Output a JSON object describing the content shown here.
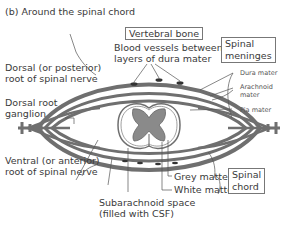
{
  "title": "(b)  Around the spinal chord",
  "labels": {
    "vertebral_bone": "Vertebral bone",
    "blood_vessels_1": "Blood vessels  between",
    "blood_vessels_2": "layers of dura mater",
    "spinal_meninges_1": "Spinal",
    "spinal_meninges_2": "meninges",
    "dura_mater": "Dura mater",
    "arachnoid_mater_1": "Arachnoid",
    "arachnoid_mater_2": "mater",
    "pia_mater": "Pia mater",
    "dorsal_root_1": "Dorsal (or posterior)",
    "dorsal_root_2": "root of spinal nerve",
    "dorsal_ganglion_1": "Dorsal root",
    "dorsal_ganglion_2": "ganglion",
    "ventral_root_1": "Ventral (or anterior)",
    "ventral_root_2": "root of spinal nerve",
    "grey_matter": "Grey matter",
    "white_matter": "White matter",
    "spinal_chord_1": "Spinal",
    "spinal_chord_2": "chord",
    "subarachnoid_1": "Subarachnoid space",
    "subarachnoid_2": "(filled with CSF)"
  },
  "colors": {
    "membrane": "#6f6f6f",
    "grey_matter": "#8a8a8a",
    "line": "#555555"
  }
}
